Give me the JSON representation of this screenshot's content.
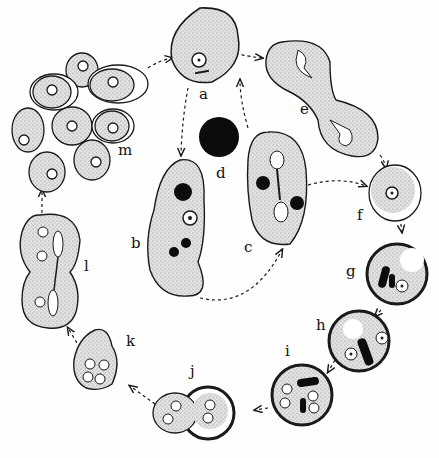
{
  "diagram": {
    "type": "life-cycle illustration",
    "labels": {
      "a": "a",
      "b": "b",
      "c": "c",
      "d": "d",
      "e": "e",
      "f": "f",
      "g": "g",
      "h": "h",
      "i": "i",
      "j": "j",
      "k": "k",
      "l": "l",
      "m": "m"
    },
    "colors": {
      "ink": "#1a1a1a",
      "cytoplasm": "#dcdcdc",
      "background": "#fefefe"
    }
  }
}
